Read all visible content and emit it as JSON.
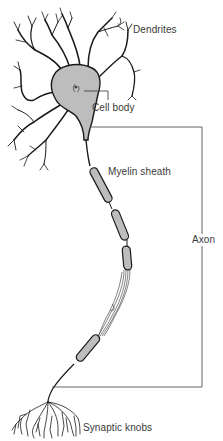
{
  "diagram": {
    "colors": {
      "outline": "#1a1a1a",
      "fill": "#bdbdbd",
      "leader_line": "#333333",
      "label_text": "#3a3a3a",
      "background": "#ffffff"
    },
    "labels": {
      "dendrites": "Dendrites",
      "cell_body": "Cell body",
      "myelin_sheath": "Myelin sheath",
      "axon": "Axon",
      "synaptic_knobs": "Synaptic knobs"
    },
    "parts": [
      {
        "id": "dendrites",
        "label": "Dendrites"
      },
      {
        "id": "cell-body",
        "label": "Cell body"
      },
      {
        "id": "myelin-sheath",
        "label": "Myelin sheath"
      },
      {
        "id": "axon",
        "label": "Axon"
      },
      {
        "id": "synaptic-knobs",
        "label": "Synaptic knobs"
      }
    ]
  }
}
